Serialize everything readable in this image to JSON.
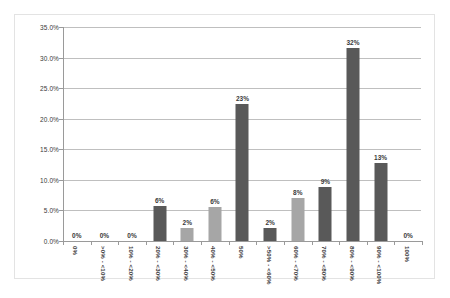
{
  "chart_data": {
    "type": "bar",
    "title": "",
    "subtitle": "",
    "xlabel": "",
    "ylabel": "",
    "ylim": [
      0,
      35
    ],
    "grid": true,
    "legend": null,
    "y_ticks": [
      "0.0%",
      "5.0%",
      "10.0%",
      "15.0%",
      "20.0%",
      "25.0%",
      "30.0%",
      "35.0%"
    ],
    "y_tick_values": [
      0,
      5,
      10,
      15,
      20,
      25,
      30,
      35
    ],
    "categories": [
      "0%",
      ">0% - <10%",
      "10% - <20%",
      "20% - <30%",
      "30% - <40%",
      "40% - <50%",
      "50%",
      ">50% - <60%",
      "60% - <70%",
      "70% - <80%",
      "80% - <90%",
      "90% - <100%",
      "100%"
    ],
    "values": [
      0,
      0,
      0,
      5.7,
      2.1,
      5.6,
      22.4,
      2.2,
      7.1,
      8.8,
      31.6,
      12.8,
      0
    ],
    "data_labels": [
      "0%",
      "0%",
      "0%",
      "6%",
      "2%",
      "6%",
      "23%",
      "2%",
      "8%",
      "9%",
      "32%",
      "13%",
      "0%"
    ],
    "bar_shades": [
      "dark",
      "light",
      "dark",
      "dark",
      "light",
      "light",
      "dark",
      "dark",
      "light",
      "dark",
      "dark",
      "dark",
      "light"
    ],
    "colors": {
      "bar_dark": "#595959",
      "bar_light": "#a6a6a6",
      "gridline": "#bfbfbf",
      "axis": "#9a9a9a",
      "text": "#3a3a3a",
      "frame": "#e3e3e3",
      "background": "#ffffff"
    }
  }
}
